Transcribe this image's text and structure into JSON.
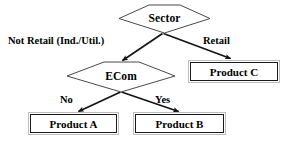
{
  "diagram": {
    "type": "decision-tree",
    "background_color": "#ffffff",
    "line_color": "#1a1a1a",
    "box_border_outer_color": "#bdbdbd",
    "box_border_inner_color": "#1a1a1a",
    "text_color": "#000000"
  },
  "nodes": {
    "root": {
      "label": "Sector",
      "shape": "pentagon",
      "kind": "decision"
    },
    "ecom": {
      "label": "ECom",
      "shape": "pentagon",
      "kind": "decision"
    },
    "product_a": {
      "label": "Product A",
      "shape": "rectangle",
      "kind": "outcome"
    },
    "product_b": {
      "label": "Product B",
      "shape": "rectangle",
      "kind": "outcome"
    },
    "product_c": {
      "label": "Product C",
      "shape": "rectangle",
      "kind": "outcome"
    }
  },
  "edges": {
    "root_left": {
      "label": "Not Retail (Ind./Util.)",
      "from": "Sector",
      "to": "ECom"
    },
    "root_right": {
      "label": "Retail",
      "from": "Sector",
      "to": "Product C"
    },
    "ecom_left": {
      "label": "No",
      "from": "ECom",
      "to": "Product A"
    },
    "ecom_right": {
      "label": "Yes",
      "from": "ECom",
      "to": "Product B"
    }
  }
}
